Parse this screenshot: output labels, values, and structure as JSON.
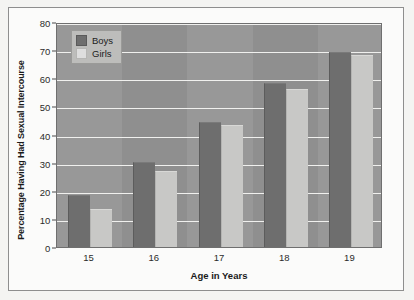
{
  "chart_data": {
    "type": "bar",
    "title": "",
    "subtitle": "",
    "xlabel": "Age in Years",
    "ylabel": "Percentage Having Had Sexual Intercourse",
    "categories": [
      "15",
      "16",
      "17",
      "18",
      "19"
    ],
    "series": [
      {
        "name": "Boys",
        "color": "#6e6e6e",
        "values": [
          18,
          30,
          44,
          58,
          69
        ]
      },
      {
        "name": "Girls",
        "color": "#c8c8c6",
        "values": [
          13,
          26.5,
          43,
          56,
          68
        ]
      }
    ],
    "ylim": [
      0,
      80
    ],
    "ytick_labels": [
      "0",
      "10",
      "20",
      "30",
      "40",
      "50",
      "60",
      "70",
      "80"
    ],
    "ytick_values": [
      0,
      10,
      20,
      30,
      40,
      50,
      60,
      70,
      80
    ],
    "grid": true,
    "grid_axis": "y",
    "grid_color": "#f0f0ee",
    "legend_position": "top-left",
    "plot_background": "#8f8f8f",
    "figure_background": "#fbfbfa"
  },
  "legend": {
    "items": [
      {
        "label": "Boys"
      },
      {
        "label": "Girls"
      }
    ]
  },
  "axes": {
    "y_title": "Percentage Having Had Sexual Intercourse",
    "x_title": "Age in Years"
  }
}
